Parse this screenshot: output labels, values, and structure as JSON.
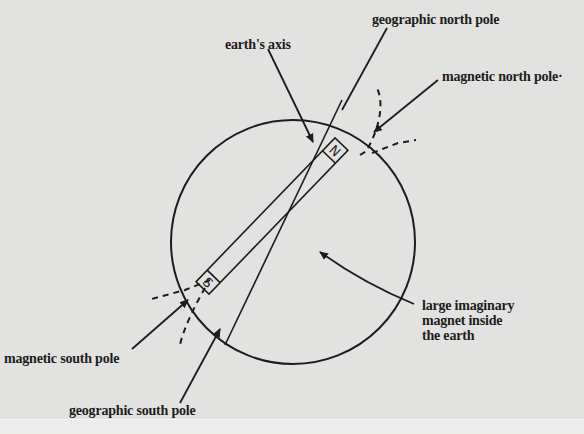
{
  "diagram": {
    "labels": {
      "earths_axis": "earth's axis",
      "geographic_north_pole": "geographic north pole",
      "magnetic_north_pole": "magnetic north pole·",
      "magnetic_south_pole": "magnetic south pole",
      "geographic_south_pole": "geographic south pole",
      "magnet_line1": "large imaginary",
      "magnet_line2": "magnet inside",
      "magnet_line3": "the earth"
    },
    "magnet_poles": {
      "north": "N",
      "south": "S"
    },
    "colors": {
      "background": "#e2e2e0",
      "ink": "#1c1c1c"
    }
  }
}
